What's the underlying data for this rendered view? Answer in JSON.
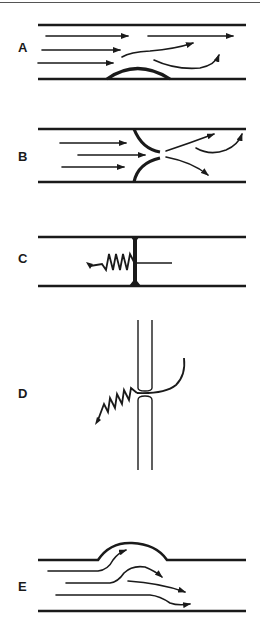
{
  "figure": {
    "panels": [
      {
        "id": "A",
        "label": "A",
        "description": "Flow over a low mound on the bottom wall; streamlines deflect upward past it"
      },
      {
        "id": "B",
        "label": "B",
        "description": "Symmetric constriction (two curved lips) forming a narrow orifice; jet diverges downstream"
      },
      {
        "id": "C",
        "label": "C",
        "description": "Vertical septum across channel with a coiled spring-like element and a horizontal rod through it"
      },
      {
        "id": "D",
        "label": "D",
        "description": "Vertical double-walled tube with a gap; coiled element enters from lower left and a curved hook exits to upper right"
      },
      {
        "id": "E",
        "label": "E",
        "description": "Bulge in upper wall; streamlines curve up into the bulge and back down"
      }
    ]
  },
  "labels": {
    "a": "A",
    "b": "B",
    "c": "C",
    "d": "D",
    "e": "E"
  },
  "colors": {
    "ink": "#1a1a1a",
    "background": "#ffffff"
  }
}
